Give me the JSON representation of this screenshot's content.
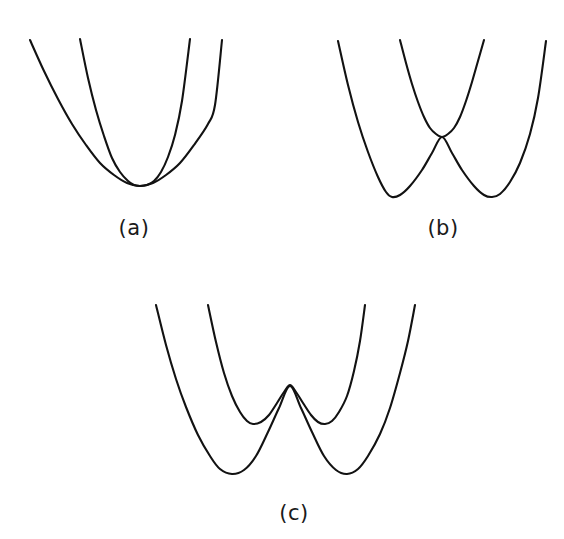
{
  "figure": {
    "kind": "potential-energy-curve-figure",
    "background_color": "#ffffff",
    "stroke_color": "#121212",
    "stroke_width": 2.1,
    "width": 564,
    "height": 539,
    "panel_count": 3
  },
  "panels": {
    "a": {
      "label": "(a)",
      "label_x": 134,
      "label_y": 235,
      "description": "Two parabolas sharing one common minimum",
      "curve_count": 2
    },
    "b": {
      "label": "(b)",
      "label_x": 443,
      "label_y": 235,
      "description": "Double well touching a narrow parabola at a single cusp point",
      "curve_count": 2
    },
    "c": {
      "label": "(c)",
      "label_x": 294,
      "label_y": 520,
      "description": "Two nested double-well curves with a central barrier",
      "curve_count": 2
    }
  },
  "chart_data": {
    "type": "line",
    "title": "",
    "xlabel": "",
    "ylabel": "",
    "grid": false,
    "legend": false,
    "axes_visible": false,
    "panels": [
      {
        "id": "a",
        "label": "(a)",
        "xlim": [
          0,
          564
        ],
        "ylim": [
          0,
          539
        ],
        "y_axis_inverted": true,
        "series": [
          {
            "name": "wide-parabola",
            "vertex": [
              140,
              186
            ],
            "x_start": 30,
            "x_end": 222,
            "y_top_left": 40,
            "y_top_right": 40,
            "points": [
              [
                30,
                40
              ],
              [
                44,
                71
              ],
              [
                58,
                99
              ],
              [
                72,
                124
              ],
              [
                86,
                145
              ],
              [
                100,
                163
              ],
              [
                114,
                175
              ],
              [
                127,
                183
              ],
              [
                140,
                186
              ],
              [
                153,
                183
              ],
              [
                166,
                175
              ],
              [
                180,
                163
              ],
              [
                194,
                145
              ],
              [
                208,
                124
              ],
              [
                215,
                105
              ],
              [
                222,
                40
              ]
            ]
          },
          {
            "name": "narrow-parabola",
            "vertex": [
              140,
              186
            ],
            "x_start": 80,
            "x_end": 190,
            "y_top_left": 39,
            "y_top_right": 39,
            "points": [
              [
                80,
                39
              ],
              [
                88,
                78
              ],
              [
                96,
                110
              ],
              [
                104,
                136
              ],
              [
                112,
                158
              ],
              [
                120,
                172
              ],
              [
                128,
                181
              ],
              [
                134,
                185
              ],
              [
                140,
                186
              ],
              [
                147,
                185
              ],
              [
                154,
                181
              ],
              [
                161,
                172
              ],
              [
                168,
                157
              ],
              [
                175,
                135
              ],
              [
                182,
                101
              ],
              [
                190,
                39
              ]
            ]
          }
        ]
      },
      {
        "id": "b",
        "label": "(b)",
        "xlim": [
          0,
          564
        ],
        "ylim": [
          0,
          539
        ],
        "y_axis_inverted": true,
        "cusp_point": [
          442,
          137
        ],
        "series": [
          {
            "name": "double-well-lower",
            "minima": [
              [
                390,
                197
              ],
              [
                495,
                197
              ]
            ],
            "central_maximum": [
              442,
              137
            ],
            "x_start": 338,
            "x_end": 546,
            "points": [
              [
                338,
                41
              ],
              [
                348,
                85
              ],
              [
                358,
                122
              ],
              [
                368,
                152
              ],
              [
                378,
                177
              ],
              [
                386,
                192
              ],
              [
                392,
                197
              ],
              [
                400,
                195
              ],
              [
                410,
                186
              ],
              [
                422,
                170
              ],
              [
                432,
                153
              ],
              [
                442,
                137
              ],
              [
                452,
                153
              ],
              [
                462,
                170
              ],
              [
                474,
                186
              ],
              [
                484,
                195
              ],
              [
                492,
                197
              ],
              [
                500,
                194
              ],
              [
                510,
                182
              ],
              [
                520,
                163
              ],
              [
                530,
                134
              ],
              [
                538,
                98
              ],
              [
                546,
                41
              ]
            ]
          },
          {
            "name": "upper-narrow-parabola",
            "vertex": [
              442,
              137
            ],
            "x_start": 400,
            "x_end": 484,
            "points": [
              [
                400,
                40
              ],
              [
                406,
                63
              ],
              [
                412,
                84
              ],
              [
                418,
                102
              ],
              [
                424,
                117
              ],
              [
                430,
                128
              ],
              [
                436,
                134
              ],
              [
                442,
                137
              ],
              [
                448,
                134
              ],
              [
                454,
                128
              ],
              [
                460,
                117
              ],
              [
                466,
                101
              ],
              [
                472,
                82
              ],
              [
                478,
                61
              ],
              [
                484,
                40
              ]
            ]
          }
        ]
      },
      {
        "id": "c",
        "label": "(c)",
        "xlim": [
          0,
          564
        ],
        "ylim": [
          0,
          539
        ],
        "y_axis_inverted": true,
        "central_peak": [
          290,
          385
        ],
        "series": [
          {
            "name": "outer-double-well",
            "minima": [
              [
                232,
                474
              ],
              [
                347,
                474
              ]
            ],
            "central_maximum": [
              290,
              386
            ],
            "x_start": 156,
            "x_end": 415,
            "points": [
              [
                156,
                305
              ],
              [
                166,
                345
              ],
              [
                176,
                379
              ],
              [
                186,
                407
              ],
              [
                198,
                435
              ],
              [
                210,
                456
              ],
              [
                220,
                469
              ],
              [
                232,
                474
              ],
              [
                244,
                470
              ],
              [
                256,
                456
              ],
              [
                268,
                432
              ],
              [
                279,
                408
              ],
              [
                290,
                386
              ],
              [
                301,
                408
              ],
              [
                312,
                432
              ],
              [
                324,
                456
              ],
              [
                336,
                470
              ],
              [
                347,
                474
              ],
              [
                358,
                469
              ],
              [
                368,
                456
              ],
              [
                380,
                434
              ],
              [
                390,
                408
              ],
              [
                400,
                373
              ],
              [
                408,
                341
              ],
              [
                415,
                305
              ]
            ]
          },
          {
            "name": "inner-double-well",
            "minima": [
              [
                253,
                424
              ],
              [
                325,
                424
              ]
            ],
            "central_maximum": [
              290,
              385
            ],
            "x_start": 208,
            "x_end": 365,
            "points": [
              [
                208,
                305
              ],
              [
                216,
                342
              ],
              [
                224,
                373
              ],
              [
                232,
                396
              ],
              [
                240,
                412
              ],
              [
                247,
                421
              ],
              [
                253,
                424
              ],
              [
                261,
                422
              ],
              [
                269,
                415
              ],
              [
                277,
                403
              ],
              [
                284,
                392
              ],
              [
                290,
                385
              ],
              [
                296,
                392
              ],
              [
                303,
                403
              ],
              [
                311,
                415
              ],
              [
                318,
                422
              ],
              [
                325,
                424
              ],
              [
                332,
                421
              ],
              [
                339,
                412
              ],
              [
                347,
                396
              ],
              [
                354,
                371
              ],
              [
                360,
                341
              ],
              [
                365,
                305
              ]
            ]
          }
        ]
      }
    ]
  }
}
